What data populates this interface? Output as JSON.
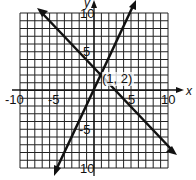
{
  "chart_data": {
    "type": "line",
    "title": "",
    "xlabel": "x",
    "ylabel": "y",
    "xlim": [
      -10,
      10
    ],
    "ylim": [
      -10,
      10
    ],
    "grid": true,
    "x_ticks": [
      "-10",
      "-5",
      "5",
      "10"
    ],
    "y_ticks": [
      "10",
      "5",
      "-5",
      "-10"
    ],
    "series": [
      {
        "name": "line1",
        "slope": 2,
        "intercept": 0,
        "points": [
          [
            -4.5,
            -9
          ],
          [
            0,
            0
          ],
          [
            1,
            2
          ],
          [
            5.5,
            11
          ]
        ],
        "note": "steep line through (1,2), arrowheads both ends"
      },
      {
        "name": "line2",
        "slope": -1,
        "intercept": 3,
        "points": [
          [
            -7,
            10
          ],
          [
            1,
            2
          ],
          [
            10,
            -7
          ]
        ],
        "note": "descending line through (1,2), arrowheads both ends"
      }
    ],
    "annotations": [
      {
        "text": "(1, 2)",
        "x": 1,
        "y": 2
      }
    ]
  },
  "labels": {
    "x_axis": "x",
    "y_axis": "y",
    "tick_x_neg10": "-10",
    "tick_x_neg5": "-5",
    "tick_x_5": "5",
    "tick_x_10": "10",
    "tick_y_10": "10",
    "tick_y_5": "5",
    "tick_y_neg5": "-5",
    "tick_y_neg10": "10",
    "intersection": "(1, 2)"
  }
}
